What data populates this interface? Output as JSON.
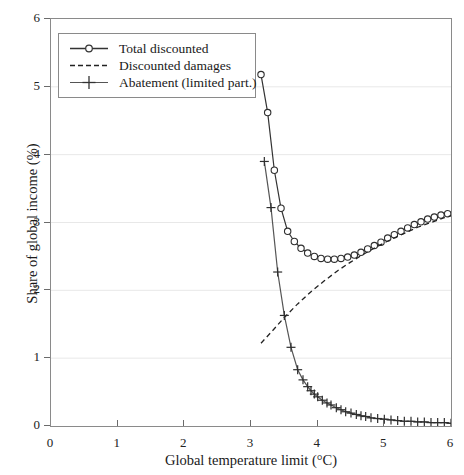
{
  "chart_data": {
    "type": "line",
    "title": "",
    "xlabel": "Global temperature limit (°C)",
    "ylabel": "Share of global income (%)",
    "xlim": [
      0,
      6
    ],
    "ylim": [
      0,
      6
    ],
    "xticks": [
      0,
      1,
      2,
      3,
      4,
      5,
      6
    ],
    "yticks": [
      0,
      1,
      2,
      3,
      4,
      5,
      6
    ],
    "grid": "horizontal",
    "legend_position": "top-left",
    "series": [
      {
        "name": "Total discounted",
        "marker": "open-circle",
        "linestyle": "solid",
        "color": "#333333",
        "x": [
          3.15,
          3.25,
          3.35,
          3.45,
          3.55,
          3.65,
          3.75,
          3.85,
          3.95,
          4.05,
          4.15,
          4.25,
          4.35,
          4.45,
          4.55,
          4.65,
          4.75,
          4.85,
          4.95,
          5.05,
          5.15,
          5.25,
          5.35,
          5.45,
          5.55,
          5.65,
          5.75,
          5.85,
          5.95
        ],
        "y": [
          5.18,
          4.62,
          3.77,
          3.21,
          2.87,
          2.72,
          2.62,
          2.55,
          2.5,
          2.47,
          2.46,
          2.46,
          2.47,
          2.49,
          2.52,
          2.56,
          2.61,
          2.66,
          2.71,
          2.77,
          2.82,
          2.87,
          2.92,
          2.97,
          3.01,
          3.05,
          3.08,
          3.11,
          3.13
        ]
      },
      {
        "name": "Discounted damages",
        "marker": "none",
        "linestyle": "dashed",
        "color": "#222222",
        "x": [
          3.15,
          3.3,
          3.5,
          3.7,
          3.9,
          4.1,
          4.3,
          4.5,
          4.7,
          4.9,
          5.1,
          5.3,
          5.5,
          5.7,
          5.9,
          6.0
        ],
        "y": [
          1.22,
          1.38,
          1.6,
          1.8,
          1.98,
          2.14,
          2.29,
          2.42,
          2.54,
          2.65,
          2.75,
          2.84,
          2.93,
          3.0,
          3.07,
          3.1
        ]
      },
      {
        "name": "Abatement (limited part.)",
        "marker": "plus",
        "linestyle": "solid",
        "color": "#555555",
        "x": [
          3.2,
          3.3,
          3.4,
          3.5,
          3.6,
          3.7,
          3.78,
          3.85,
          3.9,
          3.95,
          4.0,
          4.07,
          4.14,
          4.2,
          4.28,
          4.35,
          4.42,
          4.5,
          4.58,
          4.65,
          4.72,
          4.8,
          4.9,
          5.0,
          5.1,
          5.2,
          5.3,
          5.4,
          5.5,
          5.6,
          5.7,
          5.8,
          5.9,
          6.0
        ],
        "y": [
          3.9,
          3.22,
          2.27,
          1.63,
          1.16,
          0.83,
          0.68,
          0.58,
          0.52,
          0.47,
          0.43,
          0.38,
          0.34,
          0.31,
          0.27,
          0.24,
          0.21,
          0.19,
          0.17,
          0.15,
          0.14,
          0.12,
          0.11,
          0.1,
          0.09,
          0.08,
          0.07,
          0.07,
          0.06,
          0.06,
          0.05,
          0.05,
          0.05,
          0.04
        ]
      }
    ]
  },
  "legend": {
    "items": [
      {
        "label": "Total discounted"
      },
      {
        "label": "Discounted damages"
      },
      {
        "label": "Abatement (limited part.)"
      }
    ]
  },
  "axes": {
    "x_title": "Global temperature limit (°C)",
    "y_title": "Share of global income (%)",
    "x_tick_labels": [
      "0",
      "1",
      "2",
      "3",
      "4",
      "5",
      "6"
    ],
    "y_tick_labels": [
      "0",
      "1",
      "2",
      "3",
      "4",
      "5",
      "6"
    ]
  }
}
